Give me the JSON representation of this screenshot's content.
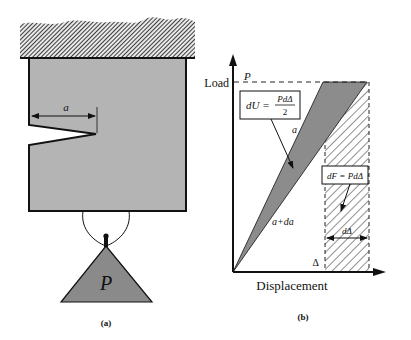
{
  "panel_a": {
    "caption": "(a)",
    "crack_length_label": "a",
    "load_label": "P",
    "colors": {
      "block_fill": "#b4b4b4",
      "weight_fill": "#8a8a8a",
      "hatch": "#2a2a2a"
    }
  },
  "panel_b": {
    "caption": "(b)",
    "y_axis_label": "Load",
    "x_axis_label": "Displacement",
    "load_level_label": "P",
    "displacement_label": "Δ",
    "curve_a_label": "a",
    "curve_a_da_label": "a+da",
    "energy_box": {
      "lhs": "dU =",
      "numerator": "PdΔ",
      "denominator": "2"
    },
    "work_box": {
      "text": "dF = PdΔ"
    },
    "increment_label": "dΔ",
    "colors": {
      "wedge_fill": "#8c8c8c",
      "axis": "#111111"
    }
  }
}
